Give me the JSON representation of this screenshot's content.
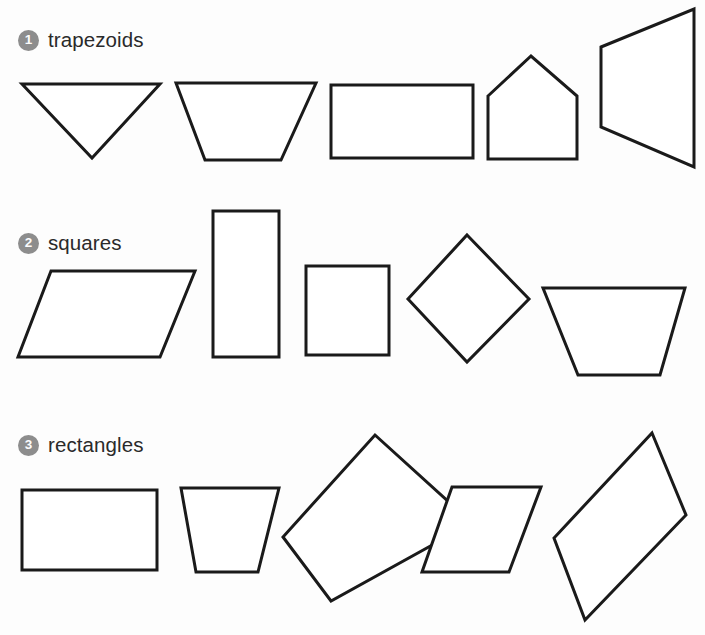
{
  "page": {
    "background_color": "#fcfcfc",
    "shape_fill": "#ffffff",
    "shape_stroke": "#1a1a1a",
    "badge_color": "#8d8d8d",
    "badge_text_color": "#fcfcfc",
    "title_color": "#2a2a2a"
  },
  "rows": [
    {
      "number": "1",
      "label": "trapezoids",
      "shapes": [
        {
          "name": "downward-triangle",
          "points": "22,84 160,84 92,158"
        },
        {
          "name": "trapezoid-wide-top",
          "points": "176,83 316,83 281,160 205,160"
        },
        {
          "name": "rectangle-horizontal",
          "points": "331,85 473,85 473,158 331,158"
        },
        {
          "name": "pentagon-house",
          "points": "488,96 531,56 577,96 577,159 488,159"
        },
        {
          "name": "trapezoid-rotated-right",
          "points": "601,47 694,9 694,167 601,127"
        }
      ]
    },
    {
      "number": "2",
      "label": "squares",
      "shapes": [
        {
          "name": "parallelogram-wide",
          "points": "51,271 195,271 160,357 18,357"
        },
        {
          "name": "rectangle-tall-vertical",
          "points": "213,211 279,211 279,357 213,357"
        },
        {
          "name": "square-upright",
          "points": "306,266 389,266 389,355 306,355"
        },
        {
          "name": "square-rotated-diamond",
          "points": "467,235 529,299 467,362 408,299"
        },
        {
          "name": "trapezoid-wide-top-2",
          "points": "543,288 685,288 660,375 578,375"
        }
      ]
    },
    {
      "number": "3",
      "label": "rectangles",
      "shapes": [
        {
          "name": "rectangle-horizontal-2",
          "points": "22,490 157,490 157,570 22,570"
        },
        {
          "name": "trapezoid-wide-top-3",
          "points": "181,488 279,488 258,572 196,572"
        },
        {
          "name": "rectangle-tilted",
          "points": "375,435 472,523 331,601 283,537"
        },
        {
          "name": "parallelogram-slanted",
          "points": "452,487 541,487 509,572 422,572"
        },
        {
          "name": "parallelogram-tilted-tall",
          "points": "652,433 686,515 585,620 554,538"
        }
      ]
    }
  ]
}
